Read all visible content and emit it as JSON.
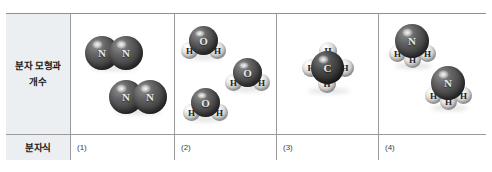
{
  "table": {
    "row_labels": {
      "models_line1": "분자 모형과",
      "models_line2": "개수",
      "formula": "분자식"
    },
    "formula_answers": [
      "(1)",
      "(2)",
      "(3)",
      "(4)"
    ],
    "columns": [
      {
        "index": 1,
        "substance": "nitrogen",
        "molecule_count": 2,
        "molecules": [
          {
            "atoms": [
              {
                "symbol": "N",
                "kind": "dark",
                "x": 2,
                "y": 8,
                "d": 34
              },
              {
                "symbol": "N",
                "kind": "dark",
                "x": 26,
                "y": 8,
                "d": 34
              }
            ]
          },
          {
            "atoms": [
              {
                "symbol": "N",
                "kind": "dark",
                "x": 2,
                "y": 8,
                "d": 34
              },
              {
                "symbol": "N",
                "kind": "dark",
                "x": 26,
                "y": 8,
                "d": 34
              }
            ]
          }
        ]
      },
      {
        "index": 2,
        "substance": "water",
        "molecule_count": 3,
        "molecules": [
          {
            "atoms": [
              {
                "symbol": "H",
                "kind": "light",
                "x": 0,
                "y": 18,
                "d": 17
              },
              {
                "symbol": "H",
                "kind": "light",
                "x": 28,
                "y": 18,
                "d": 17
              },
              {
                "symbol": "O",
                "kind": "dark",
                "x": 8,
                "y": 2,
                "d": 29
              }
            ]
          },
          {
            "atoms": [
              {
                "symbol": "H",
                "kind": "light",
                "x": 0,
                "y": 18,
                "d": 17
              },
              {
                "symbol": "H",
                "kind": "light",
                "x": 28,
                "y": 18,
                "d": 17
              },
              {
                "symbol": "O",
                "kind": "dark",
                "x": 8,
                "y": 2,
                "d": 29
              }
            ]
          },
          {
            "atoms": [
              {
                "symbol": "H",
                "kind": "light",
                "x": 0,
                "y": 18,
                "d": 17
              },
              {
                "symbol": "H",
                "kind": "light",
                "x": 28,
                "y": 18,
                "d": 17
              },
              {
                "symbol": "O",
                "kind": "dark",
                "x": 8,
                "y": 2,
                "d": 29
              }
            ]
          }
        ]
      },
      {
        "index": 3,
        "substance": "methane",
        "molecule_count": 1,
        "molecules": [
          {
            "atoms": [
              {
                "symbol": "H",
                "kind": "light",
                "x": 17,
                "y": 0,
                "d": 18
              },
              {
                "symbol": "H",
                "kind": "light",
                "x": 0,
                "y": 17,
                "d": 18
              },
              {
                "symbol": "H",
                "kind": "light",
                "x": 34,
                "y": 17,
                "d": 18
              },
              {
                "symbol": "H",
                "kind": "light",
                "x": 16,
                "y": 33,
                "d": 18
              },
              {
                "symbol": "C",
                "kind": "darker",
                "x": 9,
                "y": 9,
                "d": 33
              }
            ]
          }
        ]
      },
      {
        "index": 4,
        "substance": "ammonia",
        "molecule_count": 2,
        "molecules": [
          {
            "atoms": [
              {
                "symbol": "H",
                "kind": "light",
                "x": 0,
                "y": 21,
                "d": 17
              },
              {
                "symbol": "H",
                "kind": "light",
                "x": 30,
                "y": 21,
                "d": 17
              },
              {
                "symbol": "H",
                "kind": "light",
                "x": 15,
                "y": 27,
                "d": 17
              },
              {
                "symbol": "N",
                "kind": "dark",
                "x": 6,
                "y": 0,
                "d": 34
              }
            ]
          },
          {
            "atoms": [
              {
                "symbol": "H",
                "kind": "light",
                "x": 0,
                "y": 21,
                "d": 17
              },
              {
                "symbol": "H",
                "kind": "light",
                "x": 30,
                "y": 21,
                "d": 17
              },
              {
                "symbol": "H",
                "kind": "light",
                "x": 15,
                "y": 27,
                "d": 17
              },
              {
                "symbol": "N",
                "kind": "dark",
                "x": 6,
                "y": 0,
                "d": 34
              }
            ]
          }
        ]
      }
    ]
  },
  "layout": {
    "molecule_positions": {
      "col1": [
        {
          "left": 12,
          "top": 14
        },
        {
          "left": 36,
          "top": 58
        }
      ],
      "col2": [
        {
          "left": 6,
          "top": 10
        },
        {
          "left": 50,
          "top": 42
        },
        {
          "left": 8,
          "top": 72
        }
      ],
      "col3": [
        {
          "left": 25,
          "top": 28
        }
      ],
      "col4": [
        {
          "left": 10,
          "top": 10
        },
        {
          "left": 46,
          "top": 52
        }
      ]
    },
    "atom_font_sizes": {
      "dark": 11,
      "darker": 11,
      "light": 9
    }
  },
  "colors": {
    "table_border": "#8f8f8f",
    "inner_border": "#9a9a9a",
    "label_background": "#eceff1",
    "page_background": "#ffffff",
    "label_text": "#1a1a1a",
    "formula_text": "#3d3d3d",
    "dark_atom": "#4a4a4a",
    "light_atom": "#dadada"
  }
}
